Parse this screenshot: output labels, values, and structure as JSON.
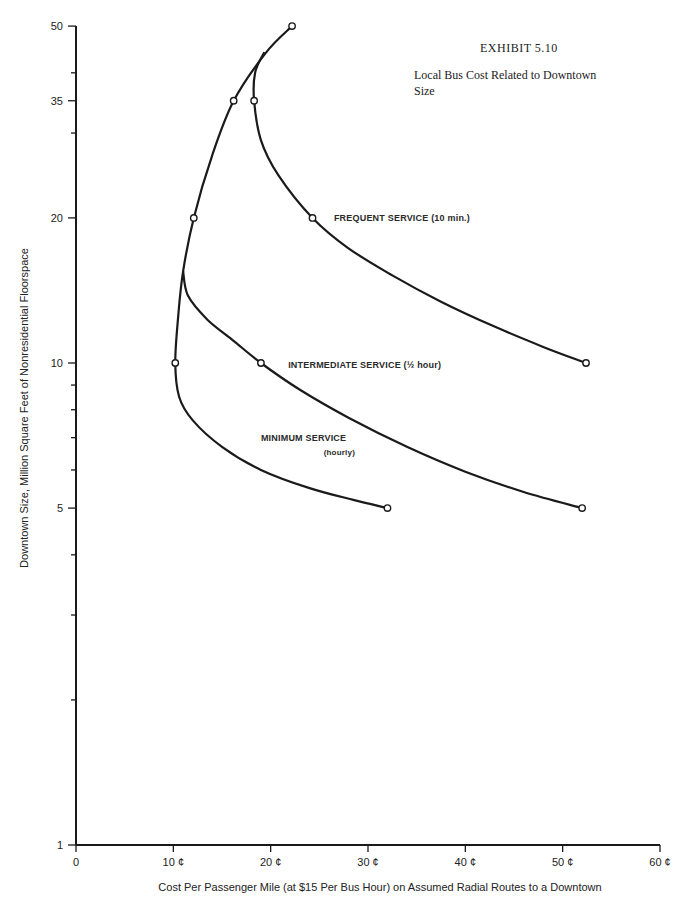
{
  "exhibit": {
    "number": "EXHIBIT  5.10",
    "title_line1": "Local Bus Cost Related to Downtown",
    "title_line2": "Size"
  },
  "chart_data": {
    "type": "line",
    "xlabel": "Cost Per Passenger Mile (at $15 Per Bus Hour) on Assumed Radial Routes to a Downtown",
    "ylabel": "Downtown Size, Million Square Feet of Nonresidential Floorspace",
    "xlim": [
      0,
      60
    ],
    "ylim": [
      1,
      50
    ],
    "yscale": "log",
    "grid": false,
    "legend": "inline labels",
    "x_ticks": [
      {
        "value": 0,
        "label": "0"
      },
      {
        "value": 10,
        "label": "10 ¢"
      },
      {
        "value": 20,
        "label": "20 ¢"
      },
      {
        "value": 30,
        "label": "30 ¢"
      },
      {
        "value": 40,
        "label": "40 ¢"
      },
      {
        "value": 50,
        "label": "50 ¢"
      },
      {
        "value": 60,
        "label": "60 ¢"
      }
    ],
    "y_ticks": [
      {
        "value": 1,
        "label": "1"
      },
      {
        "value": 5,
        "label": "5"
      },
      {
        "value": 10,
        "label": "10"
      },
      {
        "value": 20,
        "label": "20"
      },
      {
        "value": 35,
        "label": "35"
      },
      {
        "value": 50,
        "label": "50"
      }
    ],
    "y_minor_ticks": [
      2,
      3,
      4,
      6,
      7,
      8,
      9,
      30,
      40
    ],
    "series": [
      {
        "name": "MINIMUM SERVICE (hourly)",
        "label_line1": "MINIMUM SERVICE",
        "label_line2": "(hourly)",
        "points": [
          [
            22.2,
            50
          ],
          [
            16.2,
            35
          ],
          [
            12.1,
            20
          ],
          [
            10.2,
            10
          ],
          [
            32.0,
            5
          ]
        ],
        "path": [
          [
            22.2,
            50
          ],
          [
            19.5,
            44
          ],
          [
            16.2,
            35
          ],
          [
            14.0,
            27
          ],
          [
            12.1,
            20
          ],
          [
            11.0,
            15.5
          ],
          [
            10.5,
            12.5
          ],
          [
            10.2,
            10
          ],
          [
            10.6,
            8.5
          ],
          [
            12.0,
            7.6
          ],
          [
            15.0,
            6.7
          ],
          [
            19.0,
            6.0
          ],
          [
            24.0,
            5.5
          ],
          [
            28.5,
            5.2
          ],
          [
            32.0,
            5
          ]
        ]
      },
      {
        "name": "INTERMEDIATE SERVICE (½ hour)",
        "label": "INTERMEDIATE SERVICE (½ hour)",
        "points": [
          [
            19.0,
            10
          ],
          [
            52.0,
            5
          ]
        ],
        "path": [
          [
            11.0,
            15.5
          ],
          [
            11.5,
            13.8
          ],
          [
            13.5,
            12.3
          ],
          [
            16.0,
            11.2
          ],
          [
            19.0,
            10
          ],
          [
            23.0,
            8.8
          ],
          [
            28.0,
            7.7
          ],
          [
            34.0,
            6.7
          ],
          [
            40.0,
            5.95
          ],
          [
            46.0,
            5.4
          ],
          [
            52.0,
            5
          ]
        ]
      },
      {
        "name": "FREQUENT SERVICE (10 min.)",
        "label": "FREQUENT SERVICE (10 min.)",
        "points": [
          [
            18.3,
            35
          ],
          [
            24.3,
            20
          ],
          [
            52.4,
            10
          ]
        ],
        "path": [
          [
            19.3,
            44
          ],
          [
            18.4,
            40
          ],
          [
            18.3,
            35
          ],
          [
            19.0,
            29
          ],
          [
            20.8,
            24.5
          ],
          [
            24.3,
            20
          ],
          [
            28.0,
            17.3
          ],
          [
            32.5,
            15.2
          ],
          [
            37.5,
            13.4
          ],
          [
            43.0,
            11.9
          ],
          [
            48.0,
            10.8
          ],
          [
            52.4,
            10
          ]
        ]
      }
    ],
    "label_positions": {
      "frequent": [
        26.5,
        20
      ],
      "intermediate": [
        21.8,
        9.9
      ],
      "minimum_line1": [
        19.0,
        7.0
      ],
      "minimum_line2": [
        28.6,
        6.55
      ]
    }
  }
}
